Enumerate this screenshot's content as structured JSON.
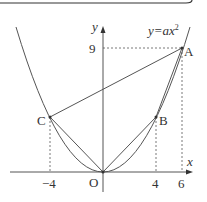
{
  "diagram": {
    "curve_label": "y=ax²",
    "curve_label_parts": {
      "pre": "y=a",
      "x": "x",
      "exp": "2"
    },
    "axes": {
      "x_label": "x",
      "y_label": "y",
      "origin_label": "O"
    },
    "points": {
      "A": {
        "label": "A",
        "x": 6,
        "y": 9
      },
      "B": {
        "label": "B",
        "x": 4,
        "y": 4
      },
      "C": {
        "label": "C",
        "x": -4,
        "y": 4
      },
      "O": {
        "label": "O",
        "x": 0,
        "y": 0
      }
    },
    "ticks": {
      "x_neg4": "−4",
      "x_4": "4",
      "x_6": "6",
      "y_9": "9"
    },
    "a_value": 0.25,
    "line_color": "#555555"
  }
}
